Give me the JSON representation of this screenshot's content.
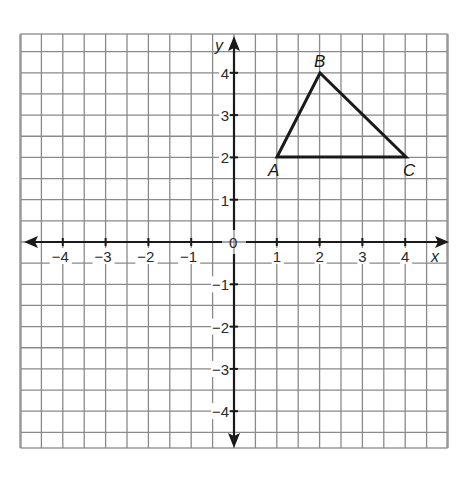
{
  "chart_data": {
    "type": "scatter",
    "title": "",
    "xlabel": "x",
    "ylabel": "y",
    "xlim": [
      -5,
      5
    ],
    "ylim": [
      -5,
      5
    ],
    "grid": true,
    "grid_step": 0.5,
    "x_ticks": [
      -4,
      -3,
      -2,
      -1,
      1,
      2,
      3,
      4
    ],
    "y_ticks": [
      -4,
      -3,
      -2,
      -1,
      1,
      2,
      3,
      4
    ],
    "origin_label": "0",
    "shape": "triangle",
    "points": [
      {
        "label": "A",
        "x": 1,
        "y": 2
      },
      {
        "label": "B",
        "x": 2,
        "y": 4
      },
      {
        "label": "C",
        "x": 4,
        "y": 2
      }
    ]
  },
  "axes": {
    "x_name": "x",
    "y_name": "y",
    "origin": "0",
    "x_tick_labels": [
      "−4",
      "−3",
      "−2",
      "−1",
      "1",
      "2",
      "3",
      "4"
    ],
    "y_tick_labels": [
      "4",
      "3",
      "2",
      "1",
      "−1",
      "−2",
      "−3",
      "−4"
    ]
  },
  "vertices": {
    "a": "A",
    "b": "B",
    "c": "C"
  }
}
